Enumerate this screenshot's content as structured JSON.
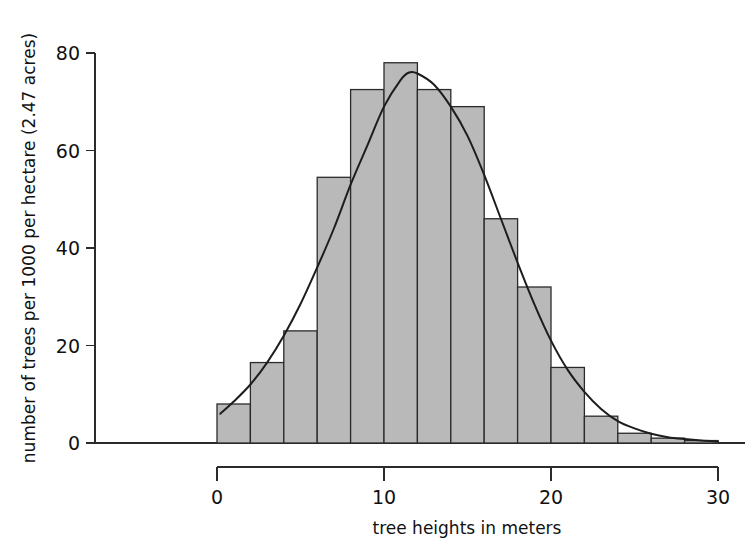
{
  "figure": {
    "background_color": "#ffffff",
    "bar_fill_color": "#b9b9b9",
    "bar_stroke_color": "#2b2b2b",
    "curve_color": "#1d1d1d",
    "axis_color": "#2b2b2b"
  },
  "axes": {
    "x_title": "tree heights in meters",
    "y_title": "number of trees per 1000 per hectare (2.47 acres)",
    "x_ticks": [
      "0",
      "10",
      "20",
      "30"
    ],
    "y_ticks": [
      "0",
      "20",
      "40",
      "60",
      "80"
    ]
  },
  "chart_data": {
    "type": "bar",
    "title": "",
    "subtitle": "",
    "xlabel": "tree heights in meters",
    "ylabel": "number of trees per 1000 per hectare (2.47 acres)",
    "xlim": [
      0,
      30
    ],
    "ylim": [
      0,
      80
    ],
    "xticks": [
      0,
      10,
      20,
      30
    ],
    "yticks": [
      0,
      20,
      40,
      60,
      80
    ],
    "grid": false,
    "legend": null,
    "bin_width": 2,
    "bin_edges": [
      0,
      2,
      4,
      6,
      8,
      10,
      12,
      14,
      16,
      18,
      20,
      22,
      24,
      26,
      28,
      30
    ],
    "categories": [
      "0-2",
      "2-4",
      "4-6",
      "6-8",
      "8-10",
      "10-12",
      "12-14",
      "14-16",
      "16-18",
      "18-20",
      "20-22",
      "22-24",
      "24-26",
      "26-28",
      "28-30"
    ],
    "bin_centers": [
      1,
      3,
      5,
      7,
      9,
      11,
      13,
      15,
      17,
      19,
      21,
      23,
      25,
      27,
      29
    ],
    "values": [
      8,
      16.5,
      23,
      54.5,
      72.5,
      78,
      72.5,
      69,
      46,
      32,
      15.5,
      5.5,
      2,
      1,
      0.5
    ],
    "overlay": {
      "type": "line",
      "name": "fitted normal curve",
      "peak_x": 11.5,
      "peak_y": 76,
      "x": [
        0.2,
        1,
        2,
        3,
        4,
        5,
        6,
        7,
        8,
        9,
        10,
        11,
        11.5,
        12,
        13,
        14,
        15,
        16,
        17,
        18,
        19,
        20,
        21,
        22,
        23,
        24,
        25,
        26,
        27,
        28,
        29,
        30
      ],
      "y": [
        6,
        8.5,
        12,
        16.5,
        22,
        28.5,
        36,
        44,
        53,
        61,
        69,
        74.5,
        76,
        75.8,
        73.5,
        69,
        63,
        55,
        46,
        37,
        28.5,
        21,
        15,
        10.5,
        7,
        4.5,
        3,
        1.9,
        1.2,
        0.8,
        0.5,
        0.3
      ]
    }
  }
}
